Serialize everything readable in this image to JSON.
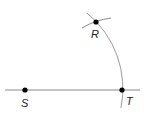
{
  "diagram": {
    "type": "geometric-construction",
    "points": [
      {
        "id": "S",
        "label": "S",
        "x": 25,
        "y": 90
      },
      {
        "id": "T",
        "label": "T",
        "x": 122,
        "y": 90
      },
      {
        "id": "R",
        "label": "R",
        "x": 96,
        "y": 22
      }
    ],
    "line": {
      "from": [
        5,
        90
      ],
      "to": [
        140,
        90
      ],
      "color": "#888888"
    },
    "arc_color": "#999999",
    "point_color": "#000000"
  }
}
